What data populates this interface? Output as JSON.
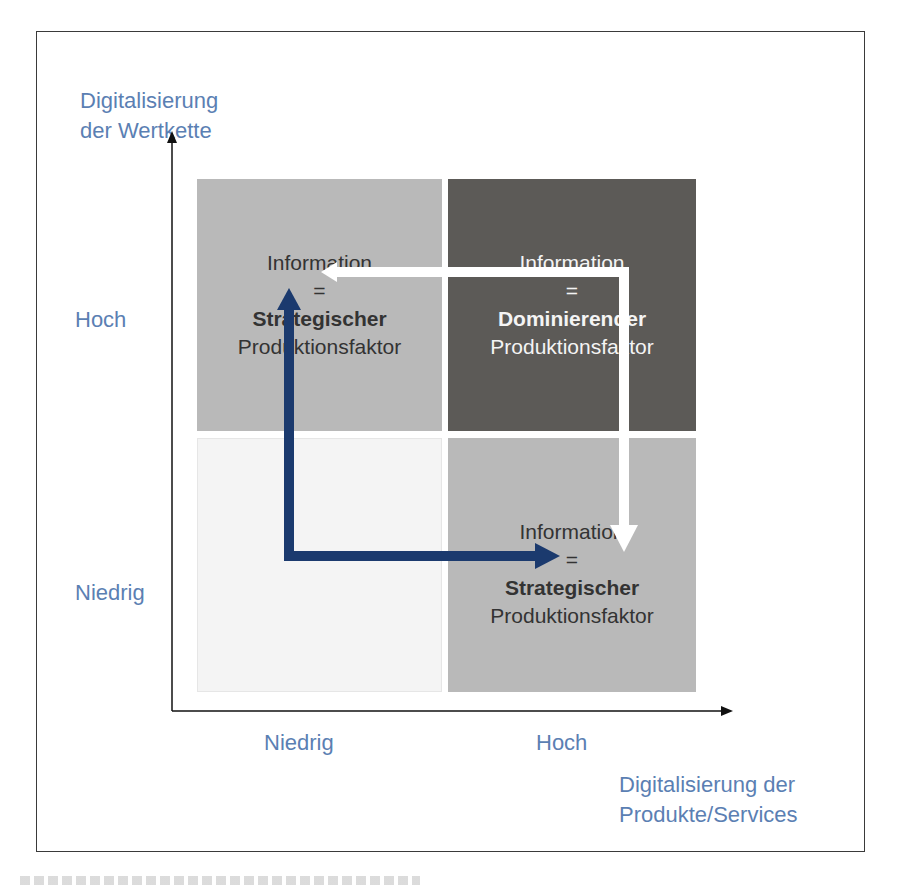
{
  "diagram": {
    "y_axis": {
      "title_line1": "Digitalisierung",
      "title_line2": "der Wertkette",
      "tick_high": "Hoch",
      "tick_low": "Niedrig"
    },
    "x_axis": {
      "title_line1": "Digitalisierung der",
      "title_line2": "Produkte/Services",
      "tick_low": "Niedrig",
      "tick_high": "Hoch"
    },
    "quadrants": {
      "top_left": {
        "line1": "Information",
        "line2": "=",
        "line3": "Strategischer",
        "line4": "Produktionsfaktor",
        "fill": "#b9b9b9",
        "text_color": "#333333"
      },
      "top_right": {
        "line1": "Information",
        "line2": "=",
        "line3": "Dominierender",
        "line4": "Produktionsfaktor",
        "fill": "#5c5a57",
        "text_color": "#f4f4f4"
      },
      "bottom_left": {
        "line1": "",
        "fill": "#f4f4f4"
      },
      "bottom_right": {
        "line1": "Information",
        "line2": "=",
        "line3": "Strategischer",
        "line4": "Produktionsfaktor",
        "fill": "#b9b9b9",
        "text_color": "#333333"
      }
    },
    "arrows": {
      "navy_color": "#1b3a6e",
      "white_color": "#ffffff"
    },
    "colors": {
      "axis_label": "#5b7fb3",
      "frame": "#3a3a3a"
    }
  }
}
